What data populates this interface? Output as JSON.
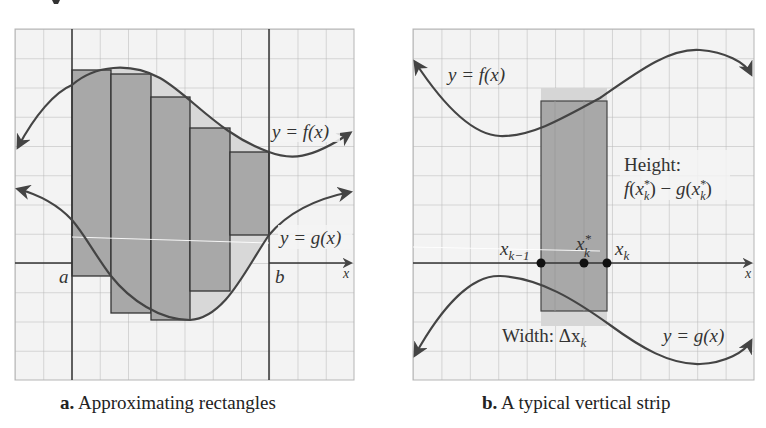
{
  "panel_a": {
    "caption_letter": "a.",
    "caption_text": "Approximating rectangles",
    "label_f": "y = f(x)",
    "label_g": "y = g(x)",
    "label_a": "a",
    "label_b": "b",
    "axis_x": "x",
    "rectangles": [
      {
        "x0": 72,
        "x1": 111,
        "top": 70,
        "bottom": 276
      },
      {
        "x0": 111,
        "x1": 151,
        "top": 74,
        "bottom": 313
      },
      {
        "x0": 151,
        "x1": 190,
        "top": 97,
        "bottom": 320
      },
      {
        "x0": 190,
        "x1": 230,
        "top": 128,
        "bottom": 291
      },
      {
        "x0": 230,
        "x1": 269,
        "top": 152,
        "bottom": 235
      }
    ]
  },
  "panel_b": {
    "caption_letter": "b.",
    "caption_text": "A typical vertical strip",
    "label_f": "y = f(x)",
    "label_g": "y = g(x)",
    "height_label": "Height:",
    "height_formula": "f(x*k) − g(x*k)",
    "width_label": "Width: Δx",
    "width_sub": "k",
    "point_left": "x",
    "point_left_sub": "k−1",
    "point_mid": "x",
    "point_mid_sub": "k",
    "point_mid_sup": "*",
    "point_right": "x",
    "point_right_sub": "k",
    "axis_x": "x"
  },
  "colors": {
    "grid": "#b8b8b8",
    "rect_fill": "#a9a9a9",
    "light_fill": "#d6d6d6",
    "curve": "#444444",
    "background": "#f4f4f4"
  }
}
